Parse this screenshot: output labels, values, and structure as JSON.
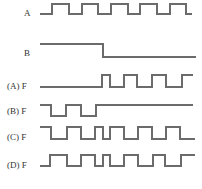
{
  "diagram": {
    "line_color": "#6b6b6b",
    "label_color": "#333333",
    "signals": [
      {
        "id": "A",
        "label": "A",
        "label_x": 24,
        "label_y": 16,
        "high_y": 4,
        "low_y": 14,
        "start_level": "low",
        "x_start": 40,
        "transitions": [
          52,
          69,
          82,
          98,
          111,
          128,
          140,
          157,
          170,
          186
        ],
        "x_end": 192
      },
      {
        "id": "B",
        "label": "B",
        "label_x": 24,
        "label_y": 56,
        "high_y": 44,
        "low_y": 57,
        "start_level": "high",
        "x_start": 40,
        "transitions": [
          103
        ],
        "x_end": 196
      },
      {
        "id": "option-a",
        "label": "(A) F",
        "label_x": 7,
        "label_y": 89,
        "high_y": 75,
        "low_y": 87,
        "start_level": "low",
        "x_start": 40,
        "transitions": [
          102,
          110,
          124,
          137,
          152,
          166,
          182
        ],
        "x_end": 193
      },
      {
        "id": "option-b",
        "label": "(B) F",
        "label_x": 7,
        "label_y": 114,
        "high_y": 105,
        "low_y": 116,
        "start_level": "high",
        "x_start": 40,
        "transitions": [
          51,
          66,
          81,
          96
        ],
        "x_end": 193
      },
      {
        "id": "option-c",
        "label": "(C) F",
        "label_x": 7,
        "label_y": 140,
        "high_y": 127,
        "low_y": 139,
        "start_level": "high",
        "x_start": 40,
        "transitions": [
          51,
          67,
          81,
          95,
          103,
          110,
          124,
          138,
          152,
          166,
          180
        ],
        "x_end": 195
      },
      {
        "id": "option-d",
        "label": "(D) F",
        "label_x": 7,
        "label_y": 168,
        "high_y": 155,
        "low_y": 166,
        "start_level": "low",
        "x_start": 40,
        "transitions": [
          50,
          67,
          81,
          95,
          103,
          110,
          124,
          138,
          153,
          165,
          181
        ],
        "x_end": 195
      }
    ]
  }
}
